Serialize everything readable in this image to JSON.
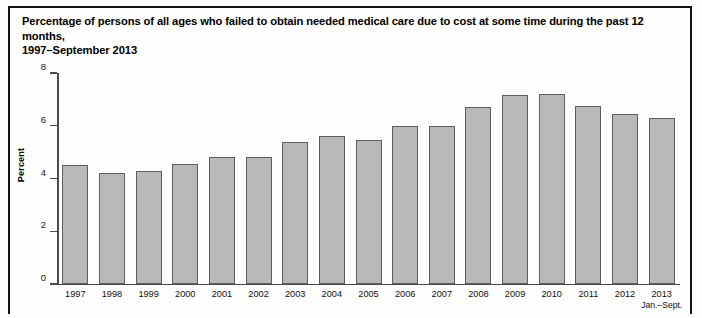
{
  "figure": {
    "title_line1": "Percentage of persons of all ages who failed to obtain needed medical care due to cost at some time during the past 12 months,",
    "title_line2": "1997–September 2013"
  },
  "chart_data": {
    "type": "bar",
    "title": "Percentage of persons of all ages who failed to obtain needed medical care due to cost at some time during the past 12 months, 1997–September 2013",
    "xlabel": "",
    "ylabel": "Percent",
    "ylim": [
      0,
      8
    ],
    "yticks": [
      0,
      2,
      4,
      6,
      8
    ],
    "ytick_labels": [
      "0",
      "2",
      "4",
      "6",
      "8"
    ],
    "grid": false,
    "legend": false,
    "bar_color": "#b9b9b9",
    "bar_edge_color": "#5d5d5d",
    "categories": [
      "1997",
      "1998",
      "1999",
      "2000",
      "2001",
      "2002",
      "2003",
      "2004",
      "2005",
      "2006",
      "2007",
      "2008",
      "2009",
      "2010",
      "2011",
      "2012",
      "2013"
    ],
    "category_sublabels": [
      "",
      "",
      "",
      "",
      "",
      "",
      "",
      "",
      "",
      "",
      "",
      "",
      "",
      "",
      "",
      "",
      "Jan.–Sept."
    ],
    "values": [
      4.5,
      4.2,
      4.3,
      4.55,
      4.8,
      4.8,
      5.4,
      5.6,
      5.45,
      6.0,
      6.0,
      6.7,
      7.15,
      7.2,
      6.75,
      6.45,
      6.3
    ]
  }
}
